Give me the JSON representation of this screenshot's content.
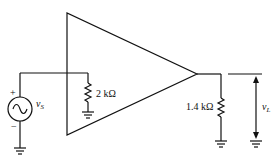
{
  "diagram": {
    "type": "amplifier-circuit",
    "source": {
      "label": "v",
      "subscript": "S",
      "plus": "+",
      "minus": "−"
    },
    "input_resistor": {
      "label": "2 kΩ"
    },
    "load_resistor": {
      "label": "1.4 kΩ"
    },
    "output_voltage": {
      "label": "v",
      "subscript": "L"
    }
  }
}
